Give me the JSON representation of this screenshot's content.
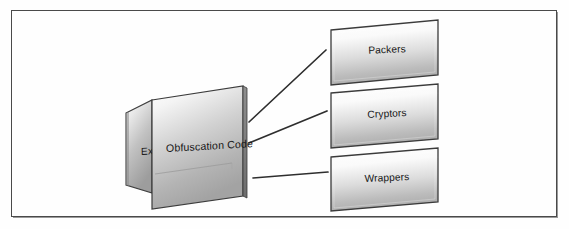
{
  "figure": {
    "type": "block-diagram",
    "background_color": "#ffffff",
    "frame_color": "#4a4a4a",
    "shape_fill_light": "#fdfdfd",
    "shape_fill_dark": "#a9a9a9",
    "shape_border_color": "#3b3b3b",
    "connector_color": "#2e2e2e",
    "text_color": "#161616"
  },
  "source_node": {
    "front_panel": {
      "label": "Obfuscation Code",
      "shape": "skewed-panel"
    },
    "back_panel": {
      "label": "Ex",
      "full_label_hidden": true,
      "shape": "skewed-panel"
    }
  },
  "target_nodes": [
    {
      "id": "packers",
      "label": "Packers",
      "shape": "tilted-rectangle"
    },
    {
      "id": "cryptors",
      "label": "Cryptors",
      "shape": "tilted-rectangle"
    },
    {
      "id": "wrappers",
      "label": "Wrappers",
      "shape": "tilted-rectangle"
    }
  ],
  "connectors": [
    {
      "from": "front_panel",
      "to": "packers"
    },
    {
      "from": "front_panel",
      "to": "cryptors"
    },
    {
      "from": "front_panel",
      "to": "wrappers"
    }
  ]
}
